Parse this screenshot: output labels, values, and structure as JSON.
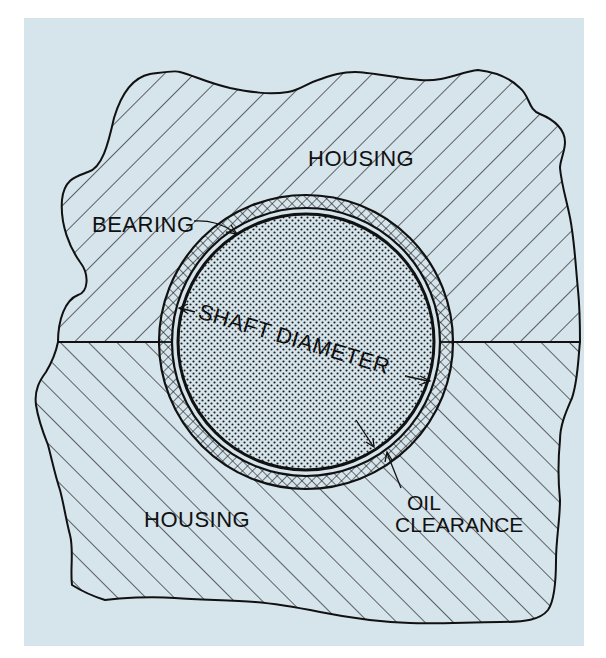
{
  "diagram": {
    "type": "cross-section",
    "colors": {
      "background_panel": "#d6e4ec",
      "page": "#ffffff",
      "ink": "#111111"
    },
    "labels": {
      "housing_top": "HOUSING",
      "housing_bottom": "HOUSING",
      "bearing": "BEARING",
      "shaft_diameter": "SHAFT DIAMETER",
      "oil_line1": "OIL",
      "oil_line2": "CLEARANCE"
    },
    "regions": [
      {
        "name": "housing-upper",
        "pattern": "diagonal-hatch-backslash"
      },
      {
        "name": "housing-lower",
        "pattern": "diagonal-hatch-slash"
      },
      {
        "name": "bearing-shell",
        "pattern": "crosshatch"
      },
      {
        "name": "oil-clearance",
        "pattern": "empty-gap"
      },
      {
        "name": "shaft",
        "pattern": "dot-stipple"
      }
    ]
  }
}
